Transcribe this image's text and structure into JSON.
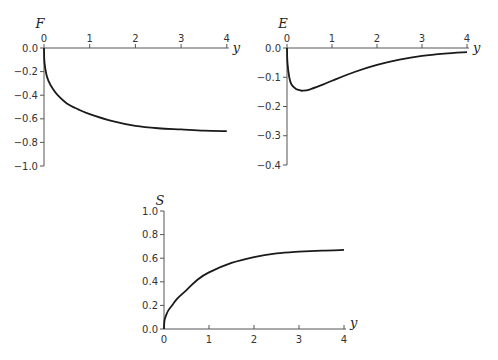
{
  "chart_data": [
    {
      "type": "line",
      "title": "",
      "ylabel": "F",
      "xlabel": "y",
      "xlim": [
        0,
        4
      ],
      "ylim": [
        -1.0,
        0.0
      ],
      "xticks": [
        "0",
        "1",
        "2",
        "3",
        "4"
      ],
      "yticks": [
        "0.0",
        "-0.2",
        "-0.4",
        "-0.6",
        "-0.8",
        "-1.0"
      ],
      "grid": false,
      "x_axis_position": "top",
      "series": [
        {
          "name": "F",
          "x": [
            0,
            0.01,
            0.05,
            0.1,
            0.2,
            0.3,
            0.5,
            0.75,
            1.0,
            1.5,
            2.0,
            2.5,
            3.0,
            3.5,
            4.0
          ],
          "values": [
            0,
            -0.12,
            -0.22,
            -0.28,
            -0.35,
            -0.4,
            -0.47,
            -0.52,
            -0.56,
            -0.62,
            -0.66,
            -0.68,
            -0.69,
            -0.7,
            -0.705
          ]
        }
      ]
    },
    {
      "type": "line",
      "title": "",
      "ylabel": "E",
      "xlabel": "y",
      "xlim": [
        0,
        4
      ],
      "ylim": [
        -0.4,
        0.0
      ],
      "xticks": [
        "0",
        "1",
        "2",
        "3",
        "4"
      ],
      "yticks": [
        "0.0",
        "-0.1",
        "-0.2",
        "-0.3",
        "-0.4"
      ],
      "grid": false,
      "x_axis_position": "top",
      "series": [
        {
          "name": "E",
          "x": [
            0,
            0.01,
            0.05,
            0.1,
            0.2,
            0.3,
            0.35,
            0.5,
            0.75,
            1.0,
            1.5,
            2.0,
            2.5,
            3.0,
            3.5,
            4.0
          ],
          "values": [
            0,
            -0.05,
            -0.1,
            -0.125,
            -0.14,
            -0.145,
            -0.146,
            -0.142,
            -0.128,
            -0.112,
            -0.082,
            -0.058,
            -0.04,
            -0.027,
            -0.019,
            -0.014
          ]
        }
      ]
    },
    {
      "type": "line",
      "title": "",
      "ylabel": "S",
      "xlabel": "y",
      "xlim": [
        0,
        4
      ],
      "ylim": [
        0.0,
        1.0
      ],
      "xticks": [
        "0",
        "1",
        "2",
        "3",
        "4"
      ],
      "yticks": [
        "0.0",
        "0.2",
        "0.4",
        "0.6",
        "0.8",
        "1.0"
      ],
      "grid": false,
      "x_axis_position": "bottom",
      "series": [
        {
          "name": "S",
          "x": [
            0,
            0.01,
            0.05,
            0.1,
            0.2,
            0.3,
            0.5,
            0.75,
            1.0,
            1.5,
            2.0,
            2.5,
            3.0,
            3.5,
            4.0
          ],
          "values": [
            0,
            0.07,
            0.12,
            0.16,
            0.21,
            0.26,
            0.33,
            0.42,
            0.48,
            0.56,
            0.61,
            0.64,
            0.655,
            0.665,
            0.67
          ]
        }
      ]
    }
  ],
  "labels": {
    "chart_f": {
      "var": "F",
      "axis": "y"
    },
    "chart_e": {
      "var": "E",
      "axis": "y"
    },
    "chart_s": {
      "var": "S",
      "axis": "y"
    }
  }
}
